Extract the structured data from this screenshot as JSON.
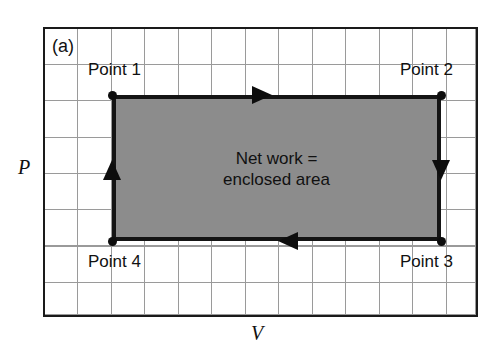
{
  "figure": {
    "panel_letter": "(a)",
    "axes": {
      "y_label": "P",
      "x_label": "V"
    },
    "annotation": {
      "line1": "Net work =",
      "line2": "enclosed area"
    },
    "points": [
      {
        "id": "point-1",
        "label": "Point 1",
        "corner": "top-left"
      },
      {
        "id": "point-2",
        "label": "Point 2",
        "corner": "top-right"
      },
      {
        "id": "point-3",
        "label": "Point 3",
        "corner": "bottom-right"
      },
      {
        "id": "point-4",
        "label": "Point 4",
        "corner": "bottom-left"
      }
    ],
    "arrows": [
      {
        "id": "arrow-top",
        "edge": "top",
        "direction": "right"
      },
      {
        "id": "arrow-right",
        "edge": "right",
        "direction": "down"
      },
      {
        "id": "arrow-bottom",
        "edge": "bottom",
        "direction": "left"
      },
      {
        "id": "arrow-left",
        "edge": "left",
        "direction": "up"
      }
    ],
    "cycle_sense": "clockwise",
    "colors": {
      "enclosed_area_fill": "#8c8c8c",
      "cycle_outline": "#141414",
      "grid_line": "#9a9a9a",
      "grid_border": "#1a1a1a",
      "background": "#ffffff",
      "text": "#111111"
    },
    "grid": {
      "columns": 13,
      "rows": 8
    }
  }
}
